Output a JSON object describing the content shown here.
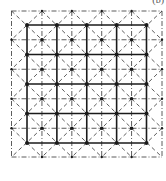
{
  "figure": {
    "label": "(b)",
    "outer": {
      "x0": 11.5,
      "y0": 11,
      "x1": 162,
      "y1": 157,
      "divisions": 5
    },
    "inner": {
      "x0": 27,
      "y0": 25,
      "x1": 146.5,
      "y1": 143,
      "divisions": 4
    },
    "colors": {
      "line": "#1a1a1a",
      "dash": "#333333",
      "background": "#ffffff"
    }
  }
}
